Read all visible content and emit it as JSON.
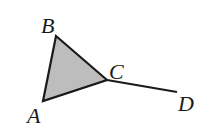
{
  "diagram": {
    "type": "geometry",
    "colors": {
      "stroke": "#1a1a1a",
      "fill": "#bdbdbd",
      "background": "#ffffff"
    },
    "points": [
      {
        "name": "A",
        "x": 43,
        "y": 101,
        "label": "A",
        "label_x": 27,
        "label_y": 123
      },
      {
        "name": "B",
        "x": 56,
        "y": 36,
        "label": "B",
        "label_x": 41,
        "label_y": 33
      },
      {
        "name": "C",
        "x": 107,
        "y": 80,
        "label": "C",
        "label_x": 109,
        "label_y": 79
      },
      {
        "name": "D",
        "x": 177,
        "y": 92,
        "label": "D",
        "label_x": 178,
        "label_y": 111
      }
    ],
    "shapes": [
      {
        "type": "triangle",
        "vertices": [
          "A",
          "B",
          "C"
        ],
        "filled": true
      },
      {
        "type": "segment",
        "from": "C",
        "to": "D"
      }
    ]
  }
}
